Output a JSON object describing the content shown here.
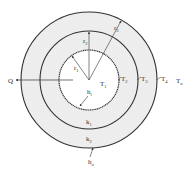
{
  "diagram": {
    "center": {
      "x": 89,
      "y": 80
    },
    "radii": {
      "r1": 30,
      "r2": 49,
      "r3": 68
    },
    "colors": {
      "line": "#333333",
      "fill_layer": "#e9e9e9",
      "background": "#ffffff"
    },
    "labels": {
      "Q": "Q",
      "r1": {
        "base": "r",
        "sub": "1"
      },
      "r2": {
        "base": "r",
        "sub": "2"
      },
      "r3": {
        "base": "r",
        "sub": "3"
      },
      "T1": {
        "base": "T",
        "sub": "1"
      },
      "T2": {
        "base": "T",
        "sub": "2"
      },
      "T3": {
        "base": "T",
        "sub": "3"
      },
      "T4": {
        "base": "T",
        "sub": "4"
      },
      "Tinf": {
        "base": "T",
        "sub": "o"
      },
      "hi": {
        "base": "h",
        "sub": "i"
      },
      "ho": {
        "base": "h",
        "sub": "o"
      },
      "k1": {
        "base": "k",
        "sub": "1"
      },
      "k2": {
        "base": "k",
        "sub": "2"
      }
    }
  }
}
